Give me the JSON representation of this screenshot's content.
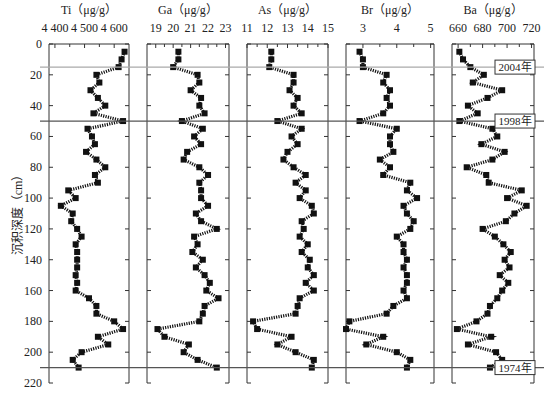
{
  "chart_data": {
    "type": "line",
    "ylabel": "沉积深度（cm）",
    "y_axis": {
      "min": 0,
      "max": 220,
      "ticks": [
        0,
        20,
        40,
        60,
        80,
        100,
        120,
        140,
        160,
        180,
        200,
        220
      ],
      "inverted": true
    },
    "depths": [
      5,
      10,
      15,
      20,
      25,
      30,
      35,
      40,
      45,
      50,
      55,
      60,
      65,
      70,
      75,
      80,
      85,
      90,
      95,
      100,
      105,
      110,
      115,
      120,
      125,
      130,
      135,
      140,
      145,
      150,
      155,
      160,
      165,
      170,
      175,
      180,
      185,
      190,
      195,
      200,
      205,
      210
    ],
    "series": [
      {
        "name": "Ti",
        "title": "Ti（μg/g）",
        "tick_labels": [
          "4 400",
          "4 500",
          "4 600"
        ],
        "tick_values": [
          4400,
          4500,
          4600
        ],
        "xlim": [
          4380,
          4650
        ],
        "values": [
          4635,
          4625,
          4615,
          4540,
          4550,
          4520,
          4545,
          4570,
          4530,
          4630,
          4510,
          4525,
          4535,
          4505,
          4540,
          4570,
          4535,
          4545,
          4445,
          4470,
          4420,
          4460,
          4455,
          4475,
          4490,
          4470,
          4475,
          4475,
          4475,
          4470,
          4475,
          4470,
          4515,
          4540,
          4540,
          4600,
          4630,
          4545,
          4580,
          4490,
          4460,
          4480
        ]
      },
      {
        "name": "Ga",
        "title": "Ga（μg/g）",
        "tick_labels": [
          "19",
          "20",
          "21",
          "22",
          "23"
        ],
        "tick_values": [
          19,
          20,
          21,
          22,
          23
        ],
        "xlim": [
          18.5,
          23.2
        ],
        "values": [
          20.3,
          20.3,
          20.0,
          21.4,
          21.5,
          21.0,
          21.6,
          21.5,
          21.8,
          20.5,
          21.7,
          21.2,
          21.6,
          20.8,
          20.6,
          21.5,
          22.0,
          21.5,
          21.6,
          21.6,
          22.0,
          21.3,
          21.6,
          22.5,
          21.2,
          21.4,
          21.1,
          21.7,
          21.3,
          21.8,
          22.1,
          21.9,
          22.6,
          21.8,
          21.7,
          21.5,
          19.1,
          19.5,
          20.9,
          20.6,
          21.4,
          22.5
        ]
      },
      {
        "name": "As",
        "title": "As（μg/g）",
        "tick_labels": [
          "11",
          "12",
          "13",
          "14",
          "15"
        ],
        "tick_values": [
          11,
          12,
          13,
          14,
          15
        ],
        "xlim": [
          11,
          15
        ],
        "values": [
          12.2,
          12.2,
          12.1,
          13.3,
          13.3,
          13.1,
          13.5,
          13.3,
          13.7,
          12.5,
          13.7,
          13.2,
          13.5,
          13.0,
          12.8,
          13.3,
          13.9,
          13.4,
          13.9,
          13.6,
          14.2,
          14.3,
          13.7,
          13.8,
          13.6,
          14.0,
          13.7,
          14.1,
          14.0,
          14.3,
          13.9,
          14.3,
          13.6,
          13.5,
          13.4,
          11.3,
          11.5,
          13.2,
          12.5,
          13.4,
          14.3,
          14.2
        ]
      },
      {
        "name": "Br",
        "title": "Br（μg/g）",
        "tick_labels": [
          "3",
          "4",
          "5"
        ],
        "tick_values": [
          3,
          4,
          5
        ],
        "xlim": [
          2.5,
          5.1
        ],
        "values": [
          2.9,
          3.0,
          3.0,
          3.7,
          3.6,
          3.8,
          3.7,
          3.8,
          3.6,
          2.9,
          4.0,
          3.8,
          3.8,
          3.9,
          3.5,
          3.8,
          3.6,
          4.4,
          4.3,
          4.6,
          4.2,
          4.3,
          4.5,
          4.4,
          4.0,
          4.2,
          4.2,
          4.3,
          4.2,
          4.3,
          4.3,
          4.2,
          4.3,
          3.9,
          3.7,
          2.6,
          2.5,
          3.6,
          3.1,
          4.0,
          4.4,
          4.3
        ]
      },
      {
        "name": "Ba",
        "title": "Ba（μg/g）",
        "tick_labels": [
          "660",
          "680",
          "700",
          "720"
        ],
        "tick_values": [
          660,
          680,
          700,
          720
        ],
        "xlim": [
          655,
          722
        ],
        "values": [
          661,
          664,
          670,
          681,
          672,
          696,
          684,
          668,
          676,
          661,
          688,
          692,
          679,
          698,
          688,
          667,
          683,
          685,
          712,
          700,
          716,
          706,
          699,
          680,
          690,
          697,
          703,
          698,
          702,
          694,
          701,
          696,
          692,
          686,
          684,
          675,
          659,
          687,
          668,
          691,
          696,
          686
        ]
      }
    ],
    "reference_lines": [
      {
        "label": "2004年",
        "depth": 15,
        "color": "#aaaaaa"
      },
      {
        "label": "1998年",
        "depth": 50,
        "color": "#555555"
      },
      {
        "label": "1974年",
        "depth": 210,
        "color": "#555555"
      }
    ]
  }
}
